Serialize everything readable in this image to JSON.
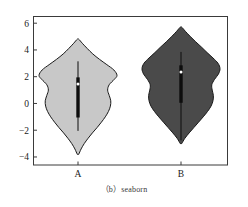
{
  "caption": "（b）seaborn",
  "colors": {
    "violin_a_fill": "#c8c8c8",
    "violin_b_fill": "#4a4a4a",
    "outline": "#1a1a1a",
    "box": "#0d0d0d",
    "median_marker": "#ffffff",
    "axis": "#3a3a3a",
    "background": "#ffffff"
  },
  "chart_data": {
    "type": "violin",
    "title": "",
    "xlabel": "",
    "ylabel": "",
    "categories": [
      "A",
      "B"
    ],
    "ylim": [
      -4.6,
      6.5
    ],
    "yticks": [
      6,
      4,
      2,
      0,
      -2,
      -4
    ],
    "ytick_labels": [
      "6",
      "4",
      "2",
      "0",
      "-2",
      "-4"
    ],
    "xticks": [
      1,
      2
    ],
    "grid": false,
    "legend": false,
    "series": [
      {
        "name": "A",
        "fill": "#c8c8c8",
        "min": -3.8,
        "max": 4.8,
        "q1": -1.05,
        "median": 1.45,
        "q3": 1.95,
        "whisker_low": -2.05,
        "whisker_high": 3.15,
        "density_profile": [
          {
            "y": -3.8,
            "w": 0.02
          },
          {
            "y": -3.4,
            "w": 0.08
          },
          {
            "y": -3.0,
            "w": 0.16
          },
          {
            "y": -2.6,
            "w": 0.26
          },
          {
            "y": -2.2,
            "w": 0.37
          },
          {
            "y": -1.8,
            "w": 0.49
          },
          {
            "y": -1.4,
            "w": 0.6
          },
          {
            "y": -1.0,
            "w": 0.7
          },
          {
            "y": -0.6,
            "w": 0.78
          },
          {
            "y": -0.2,
            "w": 0.83
          },
          {
            "y": 0.2,
            "w": 0.84
          },
          {
            "y": 0.6,
            "w": 0.8
          },
          {
            "y": 1.0,
            "w": 0.76
          },
          {
            "y": 1.4,
            "w": 0.8
          },
          {
            "y": 1.8,
            "w": 0.93
          },
          {
            "y": 2.1,
            "w": 1.0
          },
          {
            "y": 2.5,
            "w": 0.92
          },
          {
            "y": 2.9,
            "w": 0.74
          },
          {
            "y": 3.3,
            "w": 0.55
          },
          {
            "y": 3.7,
            "w": 0.38
          },
          {
            "y": 4.1,
            "w": 0.24
          },
          {
            "y": 4.5,
            "w": 0.11
          },
          {
            "y": 4.8,
            "w": 0.02
          }
        ]
      },
      {
        "name": "B",
        "fill": "#4a4a4a",
        "min": -3.0,
        "max": 5.7,
        "q1": 0.05,
        "median": 2.35,
        "q3": 2.85,
        "whisker_low": -2.75,
        "whisker_high": 3.85,
        "density_profile": [
          {
            "y": -3.0,
            "w": 0.02
          },
          {
            "y": -2.6,
            "w": 0.1
          },
          {
            "y": -2.2,
            "w": 0.21
          },
          {
            "y": -1.8,
            "w": 0.33
          },
          {
            "y": -1.4,
            "w": 0.45
          },
          {
            "y": -1.0,
            "w": 0.57
          },
          {
            "y": -0.6,
            "w": 0.68
          },
          {
            "y": -0.2,
            "w": 0.77
          },
          {
            "y": 0.2,
            "w": 0.82
          },
          {
            "y": 0.6,
            "w": 0.83
          },
          {
            "y": 1.0,
            "w": 0.8
          },
          {
            "y": 1.4,
            "w": 0.79
          },
          {
            "y": 1.8,
            "w": 0.86
          },
          {
            "y": 2.2,
            "w": 0.96
          },
          {
            "y": 2.6,
            "w": 1.0
          },
          {
            "y": 3.0,
            "w": 0.95
          },
          {
            "y": 3.4,
            "w": 0.82
          },
          {
            "y": 3.8,
            "w": 0.67
          },
          {
            "y": 4.2,
            "w": 0.53
          },
          {
            "y": 4.6,
            "w": 0.38
          },
          {
            "y": 5.0,
            "w": 0.24
          },
          {
            "y": 5.4,
            "w": 0.11
          },
          {
            "y": 5.7,
            "w": 0.02
          }
        ]
      }
    ]
  }
}
